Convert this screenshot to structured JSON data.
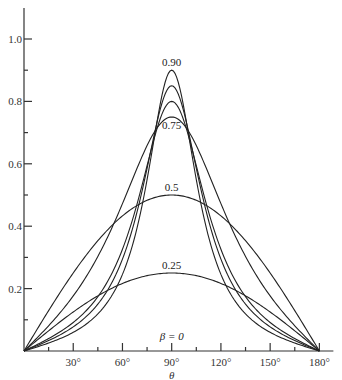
{
  "chart_data": {
    "type": "line",
    "title": "",
    "xlabel": "θ",
    "ylabel": "",
    "xlim": [
      0,
      180
    ],
    "ylim": [
      0,
      1.1
    ],
    "grid": false,
    "x_ticks": [
      {
        "value": 30,
        "label": "30°"
      },
      {
        "value": 60,
        "label": "60°"
      },
      {
        "value": 90,
        "label": "90°"
      },
      {
        "value": 120,
        "label": "120°"
      },
      {
        "value": 150,
        "label": "150°"
      },
      {
        "value": 180,
        "label": "180°"
      }
    ],
    "x_minor_ticks": [
      15,
      45,
      75,
      105,
      135,
      165
    ],
    "y_ticks": [
      {
        "value": 0.2,
        "label": "0.2"
      },
      {
        "value": 0.4,
        "label": "0.4"
      },
      {
        "value": 0.6,
        "label": "0.6"
      },
      {
        "value": 0.8,
        "label": "0.8"
      },
      {
        "value": 1.0,
        "label": "1.0"
      }
    ],
    "y_minor_ticks": [
      0.1,
      0.3,
      0.5,
      0.7,
      0.9
    ],
    "series": [
      {
        "name": "0.90",
        "peak": 0.9,
        "shape": 8.7,
        "label": "0.90",
        "x": [
          0,
          30,
          60,
          90,
          120,
          150,
          180
        ],
        "values": [
          0,
          0.06,
          0.25,
          0.9,
          0.25,
          0.06,
          0
        ]
      },
      {
        "name": "0.85",
        "peak": 0.85,
        "shape": 6.0,
        "label": "",
        "x": [
          0,
          30,
          60,
          90,
          120,
          150,
          180
        ],
        "values": [
          0,
          0.08,
          0.29,
          0.85,
          0.29,
          0.08,
          0
        ]
      },
      {
        "name": "0.80",
        "peak": 0.8,
        "shape": 4.5,
        "label": "",
        "x": [
          0,
          30,
          60,
          90,
          120,
          150,
          180
        ],
        "values": [
          0,
          0.09,
          0.33,
          0.8,
          0.33,
          0.09,
          0
        ]
      },
      {
        "name": "0.75",
        "peak": 0.75,
        "shape": 1.5,
        "label": "0.75",
        "x": [
          0,
          30,
          60,
          90,
          120,
          150,
          180
        ],
        "values": [
          0,
          0.18,
          0.47,
          0.75,
          0.47,
          0.18,
          0
        ]
      },
      {
        "name": "0.5",
        "peak": 0.5,
        "shape": 0.0,
        "label": "0.5",
        "x": [
          0,
          30,
          60,
          90,
          120,
          150,
          180
        ],
        "values": [
          0,
          0.25,
          0.43,
          0.5,
          0.43,
          0.25,
          0
        ]
      },
      {
        "name": "0.25",
        "peak": 0.25,
        "shape": 0.0,
        "label": "0.25",
        "x": [
          0,
          30,
          60,
          90,
          120,
          150,
          180
        ],
        "values": [
          0,
          0.13,
          0.22,
          0.25,
          0.22,
          0.13,
          0
        ]
      },
      {
        "name": "β = 0",
        "peak": 0.0,
        "shape": 0.0,
        "label": "β = 0",
        "x": [
          0,
          180
        ],
        "values": [
          0,
          0
        ]
      }
    ],
    "annotations": [
      "0.90",
      "0.75",
      "0.5",
      "0.25",
      "β = 0"
    ]
  },
  "layout": {
    "origin_px": [
      24,
      351
    ],
    "px_per_degree": 1.641,
    "px_per_unit": 312,
    "y_axis_top_px": 8
  }
}
